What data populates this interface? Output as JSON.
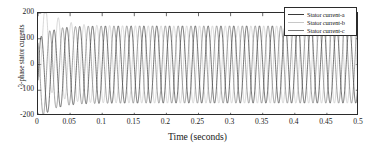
{
  "chart_data": {
    "type": "line",
    "title": "",
    "xlabel": "Time (seconds)",
    "ylabel": "3-phase stator currents",
    "xlim": [
      0,
      0.5
    ],
    "ylim": [
      -200,
      200
    ],
    "xticks": [
      "0",
      "0.05",
      "0.1",
      "0.15",
      "0.2",
      "0.25",
      "0.3",
      "0.35",
      "0.4",
      "0.45",
      "0.5"
    ],
    "xtick_values": [
      0,
      0.05,
      0.1,
      0.15,
      0.2,
      0.25,
      0.3,
      0.35,
      0.4,
      0.45,
      0.5
    ],
    "yticks": [
      "200",
      "100",
      "0",
      "-100",
      "-200"
    ],
    "ytick_values": [
      200,
      100,
      0,
      -100,
      -200
    ],
    "grid": false,
    "legend_position": "top-right",
    "frequency_hz": 50,
    "steady_state_amplitude": 150,
    "transient_duration_s": 0.06,
    "series": [
      {
        "name": "Stator current-a",
        "color": "#3a3a3a",
        "phase_deg": 0,
        "initial_offset": -60,
        "transient_peak": 160
      },
      {
        "name": "Stator current-b",
        "color": "#c8c8c8",
        "phase_deg": -120,
        "initial_offset": 120,
        "transient_peak": 165
      },
      {
        "name": "Stator current-c",
        "color": "#787878",
        "phase_deg": 120,
        "initial_offset": -55,
        "transient_peak": -190
      }
    ]
  },
  "legend": {
    "items": [
      {
        "label": "Stator current-a",
        "color": "#3a3a3a"
      },
      {
        "label": "Stator current-b",
        "color": "#c8c8c8"
      },
      {
        "label": "Stator current-c",
        "color": "#787878"
      }
    ]
  },
  "axes": {
    "frame_color": "#2b2b2b"
  }
}
